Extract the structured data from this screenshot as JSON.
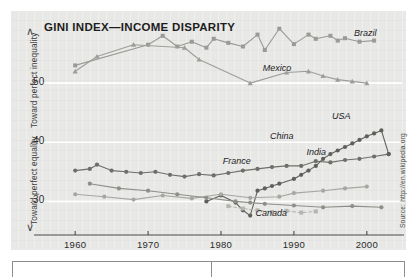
{
  "figure": {
    "title": "GINI INDEX—INCOME DISPARITY",
    "source_note": "Source: http://en.wikipedia.org",
    "axis_top_label": "Toward perfect inequality",
    "axis_bottom_label": "Toward perfect equality",
    "chevron_up": "∧",
    "chevron_down": "∨"
  },
  "chart_data": {
    "type": "line",
    "title": "GINI INDEX—INCOME DISPARITY",
    "xlabel": "",
    "ylabel": "Gini index",
    "xlim": [
      1956,
      2004
    ],
    "ylim": [
      0.255,
      0.6
    ],
    "xticks": [
      1960,
      1970,
      1980,
      1990,
      2000
    ],
    "xtick_labels": [
      "1960",
      "1970",
      "1980",
      "1990",
      "2000"
    ],
    "yticks": [
      0.3,
      0.4,
      0.5
    ],
    "ytick_labels": [
      ".30",
      ".40",
      ".50"
    ],
    "grid": "horizontal-white",
    "legend": "inline-annotations",
    "annotations": [
      {
        "text": "Toward perfect inequality",
        "position": "y-axis-upper",
        "orientation": "vertical"
      },
      {
        "text": "Toward perfect equality",
        "position": "y-axis-lower",
        "orientation": "vertical"
      },
      {
        "text": "Source: http://en.wikipedia.org",
        "position": "right-edge",
        "orientation": "vertical"
      }
    ],
    "series": [
      {
        "name": "Brazil",
        "color": "#9a9a96",
        "marker": "square",
        "label_x": 1998.5,
        "label_y": 0.573,
        "points": [
          [
            1960,
            0.53
          ],
          [
            1970,
            0.565
          ],
          [
            1972,
            0.58
          ],
          [
            1974,
            0.562
          ],
          [
            1976,
            0.57
          ],
          [
            1978,
            0.56
          ],
          [
            1979,
            0.575
          ],
          [
            1981,
            0.568
          ],
          [
            1983,
            0.562
          ],
          [
            1985,
            0.582
          ],
          [
            1986,
            0.556
          ],
          [
            1988,
            0.592
          ],
          [
            1990,
            0.566
          ],
          [
            1992,
            0.582
          ],
          [
            1993,
            0.575
          ],
          [
            1995,
            0.58
          ],
          [
            1996,
            0.572
          ],
          [
            1997,
            0.576
          ],
          [
            1999,
            0.57
          ],
          [
            2001,
            0.572
          ]
        ]
      },
      {
        "name": "Mexico",
        "color": "#9d9d99",
        "marker": "triangle",
        "label_x": 1986.0,
        "label_y": 0.513,
        "points": [
          [
            1960,
            0.52
          ],
          [
            1963,
            0.545
          ],
          [
            1968,
            0.565
          ],
          [
            1975,
            0.56
          ],
          [
            1977,
            0.54
          ],
          [
            1984,
            0.5
          ],
          [
            1989,
            0.518
          ],
          [
            1992,
            0.52
          ],
          [
            1994,
            0.512
          ],
          [
            1996,
            0.506
          ],
          [
            1998,
            0.503
          ],
          [
            2000,
            0.5
          ]
        ]
      },
      {
        "name": "USA",
        "color": "#6e6e6a",
        "marker": "circle",
        "label_x": 1995.5,
        "label_y": 0.432,
        "points": [
          [
            1960,
            0.352
          ],
          [
            1962,
            0.355
          ],
          [
            1963,
            0.362
          ],
          [
            1965,
            0.352
          ],
          [
            1967,
            0.35
          ],
          [
            1969,
            0.348
          ],
          [
            1971,
            0.35
          ],
          [
            1973,
            0.345
          ],
          [
            1975,
            0.342
          ],
          [
            1977,
            0.346
          ],
          [
            1979,
            0.344
          ],
          [
            1981,
            0.348
          ],
          [
            1983,
            0.352
          ],
          [
            1985,
            0.355
          ],
          [
            1987,
            0.358
          ],
          [
            1989,
            0.36
          ],
          [
            1991,
            0.36
          ],
          [
            1993,
            0.368
          ],
          [
            1995,
            0.366
          ],
          [
            1997,
            0.37
          ],
          [
            1999,
            0.372
          ],
          [
            2001,
            0.376
          ],
          [
            2003,
            0.38
          ]
        ]
      },
      {
        "name": "China",
        "color": "#5f5f5c",
        "marker": "circle",
        "label_x": 1987.0,
        "label_y": 0.398,
        "points": [
          [
            1978,
            0.3
          ],
          [
            1980,
            0.31
          ],
          [
            1982,
            0.298
          ],
          [
            1983,
            0.285
          ],
          [
            1984,
            0.276
          ],
          [
            1985,
            0.318
          ],
          [
            1986,
            0.322
          ],
          [
            1987,
            0.326
          ],
          [
            1988,
            0.33
          ],
          [
            1990,
            0.338
          ],
          [
            1991,
            0.345
          ],
          [
            1992,
            0.352
          ],
          [
            1993,
            0.36
          ],
          [
            1994,
            0.372
          ],
          [
            1995,
            0.38
          ],
          [
            1996,
            0.386
          ],
          [
            1997,
            0.392
          ],
          [
            1998,
            0.398
          ],
          [
            1999,
            0.404
          ],
          [
            2000,
            0.41
          ],
          [
            2001,
            0.415
          ],
          [
            2002,
            0.42
          ],
          [
            2003,
            0.38
          ]
        ]
      },
      {
        "name": "India",
        "color": "#a6a6a2",
        "marker": "circle",
        "label_x": 1992.0,
        "label_y": 0.372,
        "points": [
          [
            1960,
            0.312
          ],
          [
            1964,
            0.308
          ],
          [
            1968,
            0.303
          ],
          [
            1972,
            0.31
          ],
          [
            1976,
            0.305
          ],
          [
            1980,
            0.312
          ],
          [
            1984,
            0.306
          ],
          [
            1988,
            0.308
          ],
          [
            1990,
            0.314
          ],
          [
            1994,
            0.318
          ],
          [
            1997,
            0.322
          ],
          [
            2000,
            0.325
          ]
        ]
      },
      {
        "name": "France",
        "color": "#8e8e8a",
        "marker": "circle",
        "label_x": 1980.5,
        "label_y": 0.356,
        "points": [
          [
            1962,
            0.33
          ],
          [
            1966,
            0.322
          ],
          [
            1970,
            0.318
          ],
          [
            1974,
            0.312
          ],
          [
            1978,
            0.306
          ],
          [
            1982,
            0.3
          ],
          [
            1984,
            0.298
          ],
          [
            1986,
            0.296
          ],
          [
            1990,
            0.293
          ],
          [
            1994,
            0.29
          ],
          [
            1998,
            0.292
          ],
          [
            2002,
            0.29
          ]
        ]
      },
      {
        "name": "Canada",
        "color": "#b4b4b0",
        "marker": "square",
        "linestyle": "dashed",
        "label_x": 1985.0,
        "label_y": 0.268,
        "points": [
          [
            1981,
            0.292
          ],
          [
            1983,
            0.288
          ],
          [
            1985,
            0.285
          ],
          [
            1987,
            0.282
          ],
          [
            1989,
            0.284
          ],
          [
            1991,
            0.281
          ],
          [
            1993,
            0.283
          ]
        ]
      }
    ]
  }
}
